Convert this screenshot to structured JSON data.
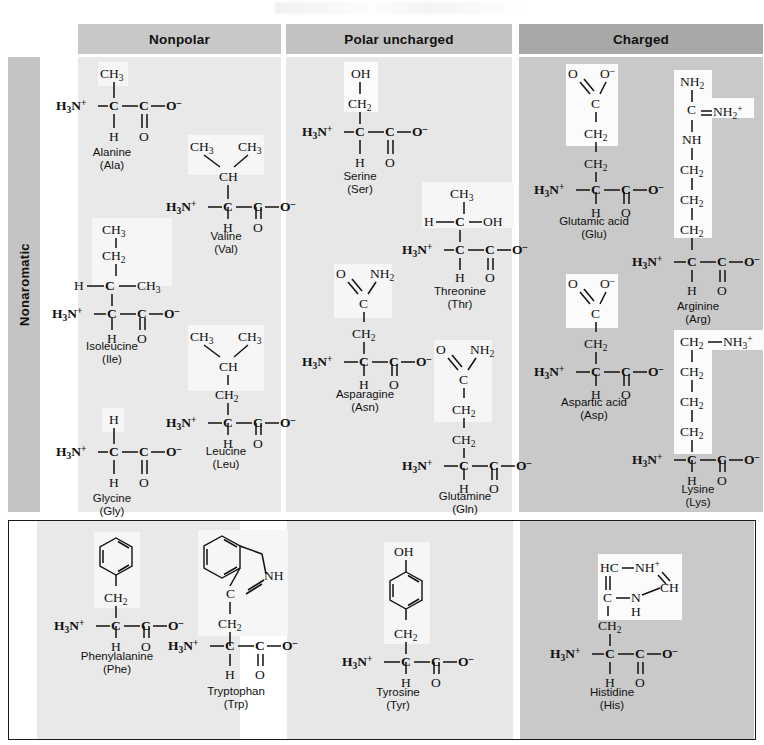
{
  "figure": {
    "type": "amino-acid-structure-chart",
    "column_headers": [
      {
        "id": "nonpolar",
        "label": "Nonpolar",
        "bg": "#c8c8c8"
      },
      {
        "id": "polar",
        "label": "Polar uncharged",
        "bg": "#c2c2c2"
      },
      {
        "id": "charged",
        "label": "Charged",
        "bg": "#a8a8a8"
      }
    ],
    "row_headers": [
      {
        "id": "nonaromatic",
        "label": "Nonaromatic"
      },
      {
        "id": "aromatic",
        "label": "Aromatic"
      }
    ]
  },
  "amino_acids": {
    "alanine": {
      "name": "Alanine",
      "abbr": "(Ala)",
      "column": "nonpolar",
      "row": "nonaromatic",
      "side_chain": "CH3"
    },
    "valine": {
      "name": "Valine",
      "abbr": "(Val)",
      "column": "nonpolar",
      "row": "nonaromatic",
      "side_chain": "CH(CH3)2"
    },
    "isoleucine": {
      "name": "Isoleucine",
      "abbr": "(Ile)",
      "column": "nonpolar",
      "row": "nonaromatic",
      "side_chain": "CH(CH3)CH2CH3"
    },
    "leucine": {
      "name": "Leucine",
      "abbr": "(Leu)",
      "column": "nonpolar",
      "row": "nonaromatic",
      "side_chain": "CH2CH(CH3)2"
    },
    "glycine": {
      "name": "Glycine",
      "abbr": "(Gly)",
      "column": "nonpolar",
      "row": "nonaromatic",
      "side_chain": "H"
    },
    "serine": {
      "name": "Serine",
      "abbr": "(Ser)",
      "column": "polar",
      "row": "nonaromatic",
      "side_chain": "CH2OH"
    },
    "threonine": {
      "name": "Threonine",
      "abbr": "(Thr)",
      "column": "polar",
      "row": "nonaromatic",
      "side_chain": "CH(OH)CH3"
    },
    "asparagine": {
      "name": "Asparagine",
      "abbr": "(Asn)",
      "column": "polar",
      "row": "nonaromatic",
      "side_chain": "CH2CONH2"
    },
    "glutamine": {
      "name": "Glutamine",
      "abbr": "(Gln)",
      "column": "polar",
      "row": "nonaromatic",
      "side_chain": "CH2CH2CONH2"
    },
    "glutamic_acid": {
      "name": "Glutamic acid",
      "abbr": "(Glu)",
      "column": "charged",
      "row": "nonaromatic",
      "side_chain": "CH2CH2COO-"
    },
    "arginine": {
      "name": "Arginine",
      "abbr": "(Arg)",
      "column": "charged",
      "row": "nonaromatic",
      "side_chain": "CH2CH2CH2NHC(NH2)=NH2+"
    },
    "aspartic_acid": {
      "name": "Aspartic acid",
      "abbr": "(Asp)",
      "column": "charged",
      "row": "nonaromatic",
      "side_chain": "CH2COO-"
    },
    "lysine": {
      "name": "Lysine",
      "abbr": "(Lys)",
      "column": "charged",
      "row": "nonaromatic",
      "side_chain": "CH2CH2CH2CH2NH3+"
    },
    "phenylalanine": {
      "name": "Phenylalanine",
      "abbr": "(Phe)",
      "column": "nonpolar",
      "row": "aromatic",
      "side_chain": "CH2-phenyl"
    },
    "tryptophan": {
      "name": "Tryptophan",
      "abbr": "(Trp)",
      "column": "nonpolar",
      "row": "aromatic",
      "side_chain": "CH2-indole"
    },
    "tyrosine": {
      "name": "Tyrosine",
      "abbr": "(Tyr)",
      "column": "polar",
      "row": "aromatic",
      "side_chain": "CH2-phenol"
    },
    "histidine": {
      "name": "Histidine",
      "abbr": "(His)",
      "column": "charged",
      "row": "aromatic",
      "side_chain": "CH2-imidazolium"
    }
  },
  "labels": {
    "amino_group": "H3N+",
    "alpha_hydrogen": "H",
    "carboxylate": "O-",
    "carbonyl_oxygen": "O",
    "carbon": "C",
    "methyl": "CH3",
    "methylene": "CH2",
    "methine": "CH",
    "hydroxyl": "OH",
    "amide": "NH2",
    "imino": "NH",
    "ammonium": "NH3+",
    "guanidinium": "NH2+",
    "hc": "HC",
    "nh_plus": "NH+",
    "ch": "CH",
    "n": "N"
  }
}
